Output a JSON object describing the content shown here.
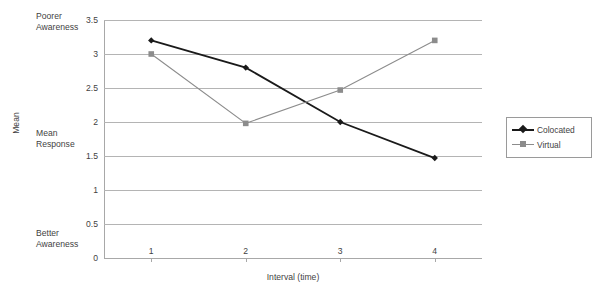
{
  "chart_data": {
    "type": "line",
    "title": "",
    "xlabel": "Interval (time)",
    "ylabel": "Mean",
    "categories": [
      "1",
      "2",
      "3",
      "4"
    ],
    "series": [
      {
        "name": "Colocated",
        "color": "#1a1a1a",
        "marker": "diamond",
        "values": [
          3.2,
          2.8,
          2.0,
          1.47
        ]
      },
      {
        "name": "Virtual",
        "color": "#8c8c8c",
        "marker": "square",
        "values": [
          3.0,
          1.98,
          2.47,
          3.2
        ]
      }
    ],
    "ylim": [
      0,
      3.5
    ],
    "ytick_values": [
      0,
      0.5,
      1,
      1.5,
      2,
      2.5,
      3,
      3.5
    ],
    "ytick_labels": [
      "0",
      "0.5",
      "1",
      "1.5",
      "2",
      "2.5",
      "3",
      "3.5"
    ],
    "grid": true,
    "legend_position": "right",
    "annotations": [
      {
        "name": "poorer-awareness",
        "text": "Poorer\nAwareness",
        "value": 3.5
      },
      {
        "name": "mean-response",
        "text": "Mean\nResponse",
        "value": 1.7
      },
      {
        "name": "better-awareness",
        "text": "Better\nAwareness",
        "value": 0.25
      }
    ]
  },
  "legend": {
    "items": [
      {
        "label": "Colocated"
      },
      {
        "label": "Virtual"
      }
    ]
  },
  "axes": {
    "x_title": "Interval (time)",
    "y_title": "Mean"
  }
}
